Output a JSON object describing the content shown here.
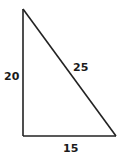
{
  "diagram": {
    "type": "right-triangle",
    "vertices": {
      "top": [
        23,
        9
      ],
      "bottom_left": [
        23,
        136
      ],
      "bottom_right": [
        116,
        136
      ]
    },
    "sides": {
      "vertical": {
        "label": "20"
      },
      "hypotenuse": {
        "label": "25"
      },
      "horizontal": {
        "label": "15"
      }
    },
    "stroke_color": "#222222",
    "label_color": "#1a1a1a"
  }
}
